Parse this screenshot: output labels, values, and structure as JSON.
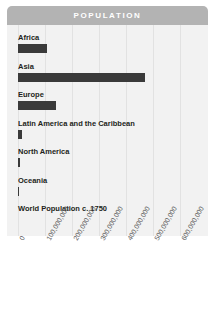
{
  "header": {
    "title": "POPULATION"
  },
  "colors": {
    "header_background": "#b3b3b3",
    "header_text": "#ffffff",
    "plot_background": "#f2f2f2",
    "bar": "#3a3a3a",
    "gridline": "#e2e2e2",
    "label_text": "#231f20",
    "tick_text": "#5b5b5b"
  },
  "chart_data": {
    "type": "bar",
    "title": "POPULATION",
    "orientation": "horizontal",
    "xlabel": "",
    "ylabel": "",
    "xlim": [
      0,
      640000000
    ],
    "grid": true,
    "legend": false,
    "categories": [
      "Africa",
      "Asia",
      "Europe",
      "Latin America and the Caribbean",
      "North America",
      "Oceania",
      "World Population c. 1750"
    ],
    "values": [
      106000000,
      471000000,
      140000000,
      16000000,
      6000000,
      2000000,
      0
    ],
    "tick_labels": [
      "0",
      "100,000,000",
      "200,000,000",
      "300,000,000",
      "400,000,000",
      "500,000,000",
      "600,000,000"
    ],
    "tick_values": [
      0,
      100000000,
      200000000,
      300000000,
      400000000,
      500000000,
      600000000
    ]
  }
}
